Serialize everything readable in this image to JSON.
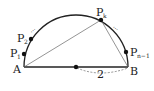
{
  "diagram": {
    "points": {
      "A": {
        "label": "A"
      },
      "B": {
        "label": "B"
      },
      "P1": {
        "label": "P",
        "sub": "1"
      },
      "P2": {
        "label": "P",
        "sub": "2"
      },
      "Pk": {
        "label": "P",
        "sub": "k"
      },
      "Pn1": {
        "label": "P",
        "sub": "n−1"
      }
    },
    "diameter_label": "2",
    "ellipsis": "⋯",
    "colors": {
      "stroke": "#222222",
      "thin": "#666666"
    }
  }
}
